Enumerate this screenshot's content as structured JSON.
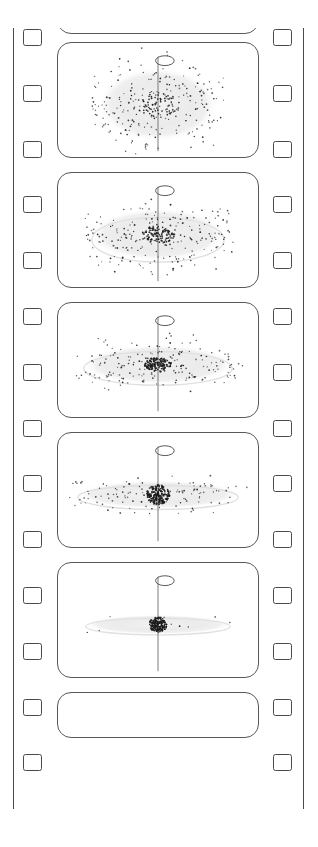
{
  "figure": {
    "type": "film-strip-sequence",
    "frame_count_visible": 5,
    "orientation": "vertical",
    "background_color": "#ffffff",
    "line_color": "#4a4a4a"
  },
  "filmstrip": {
    "edge_color": "#4a4a4a",
    "sprocket_count_per_side": 14,
    "sprocket_label": "sprocket-hole",
    "left_edge_label": "film-left-edge",
    "right_edge_label": "film-right-edge"
  },
  "chart_data": {
    "type": "scatter",
    "xlabel": "",
    "ylabel": "",
    "series": [
      {
        "name": "Frame 1 - near-spherical rotating cloud",
        "frame_index": 1,
        "disk_radius_x": 58,
        "disk_radius_y": 34,
        "core_density": 0.18,
        "core_radius": 22,
        "particle_count": 300,
        "flattening": 0.59,
        "axis_label": "rotation-axis",
        "rotation_arrow": true
      },
      {
        "name": "Frame 2 - cloud begins to flatten",
        "frame_index": 2,
        "disk_radius_x": 66,
        "disk_radius_y": 24,
        "core_density": 0.32,
        "core_radius": 17,
        "particle_count": 320,
        "flattening": 0.36,
        "axis_label": "rotation-axis",
        "rotation_arrow": true
      },
      {
        "name": "Frame 3 - disk with outer ring forming",
        "frame_index": 3,
        "disk_radius_x": 74,
        "disk_radius_y": 18,
        "core_density": 0.45,
        "core_radius": 14,
        "particle_count": 330,
        "flattening": 0.24,
        "axis_label": "rotation-axis",
        "rotation_arrow": true
      },
      {
        "name": "Frame 4 - thin disk with dense central bulge",
        "frame_index": 4,
        "disk_radius_x": 80,
        "disk_radius_y": 13,
        "core_density": 0.62,
        "core_radius": 12,
        "particle_count": 340,
        "flattening": 0.16,
        "axis_label": "rotation-axis",
        "rotation_arrow": true
      },
      {
        "name": "Frame 5 - collapsed core with thin residual disk",
        "frame_index": 5,
        "disk_radius_x": 72,
        "disk_radius_y": 9,
        "core_density": 0.95,
        "core_radius": 9,
        "particle_count": 200,
        "flattening": 0.12,
        "axis_label": "rotation-axis",
        "rotation_arrow": true
      }
    ],
    "legend_position": "none",
    "grid": false
  },
  "frames": [
    {
      "name": "frame-0-partial",
      "caption": ""
    },
    {
      "name": "frame-1",
      "caption": ""
    },
    {
      "name": "frame-2",
      "caption": ""
    },
    {
      "name": "frame-3",
      "caption": ""
    },
    {
      "name": "frame-4",
      "caption": ""
    },
    {
      "name": "frame-5",
      "caption": ""
    },
    {
      "name": "frame-6-partial",
      "caption": ""
    }
  ]
}
